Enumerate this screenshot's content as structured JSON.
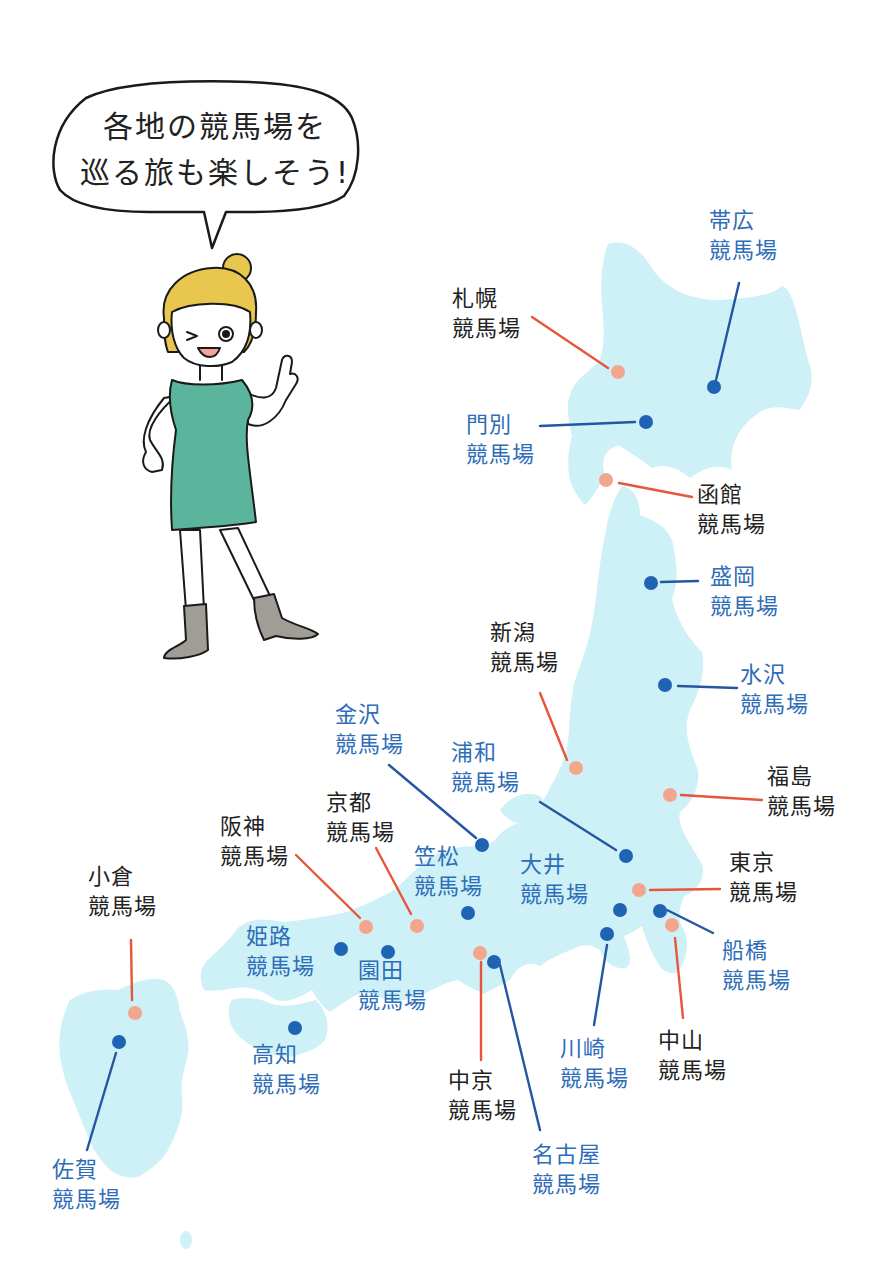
{
  "speech_bubble": {
    "line1": "各地の競馬場を",
    "line2": "巡る旅も楽しそう!"
  },
  "colors": {
    "land": "#cdf1f6",
    "jra_dot": "#f3a68e",
    "jra_line": "#e8553a",
    "nar_dot": "#1f63b5",
    "nar_line": "#2457a0",
    "jra_text": "#222222",
    "nar_text": "#2e6db8",
    "dress": "#5bb59c",
    "hair": "#e9c64d",
    "boots": "#a09c96"
  },
  "legend_note": {
    "jra": "salmon dot / black label",
    "nar": "blue dot / blue label"
  },
  "racecourses": [
    {
      "id": "obihiro",
      "name": "帯広",
      "suffix": "競馬場",
      "type": "nar"
    },
    {
      "id": "sapporo",
      "name": "札幌",
      "suffix": "競馬場",
      "type": "jra"
    },
    {
      "id": "monbetsu",
      "name": "門別",
      "suffix": "競馬場",
      "type": "nar"
    },
    {
      "id": "hakodate",
      "name": "函館",
      "suffix": "競馬場",
      "type": "jra"
    },
    {
      "id": "morioka",
      "name": "盛岡",
      "suffix": "競馬場",
      "type": "nar"
    },
    {
      "id": "niigata",
      "name": "新潟",
      "suffix": "競馬場",
      "type": "jra"
    },
    {
      "id": "mizusawa",
      "name": "水沢",
      "suffix": "競馬場",
      "type": "nar"
    },
    {
      "id": "kanazawa",
      "name": "金沢",
      "suffix": "競馬場",
      "type": "nar"
    },
    {
      "id": "urawa",
      "name": "浦和",
      "suffix": "競馬場",
      "type": "nar"
    },
    {
      "id": "fukushima",
      "name": "福島",
      "suffix": "競馬場",
      "type": "jra"
    },
    {
      "id": "kyoto",
      "name": "京都",
      "suffix": "競馬場",
      "type": "jra"
    },
    {
      "id": "hanshin",
      "name": "阪神",
      "suffix": "競馬場",
      "type": "jra"
    },
    {
      "id": "kasamatsu",
      "name": "笠松",
      "suffix": "競馬場",
      "type": "nar"
    },
    {
      "id": "ooi",
      "name": "大井",
      "suffix": "競馬場",
      "type": "nar"
    },
    {
      "id": "tokyo",
      "name": "東京",
      "suffix": "競馬場",
      "type": "jra"
    },
    {
      "id": "kokura",
      "name": "小倉",
      "suffix": "競馬場",
      "type": "jra"
    },
    {
      "id": "himeji",
      "name": "姫路",
      "suffix": "競馬場",
      "type": "nar"
    },
    {
      "id": "sonoda",
      "name": "園田",
      "suffix": "競馬場",
      "type": "nar"
    },
    {
      "id": "funabashi",
      "name": "船橋",
      "suffix": "競馬場",
      "type": "nar"
    },
    {
      "id": "kochi",
      "name": "高知",
      "suffix": "競馬場",
      "type": "nar"
    },
    {
      "id": "kawasaki",
      "name": "川崎",
      "suffix": "競馬場",
      "type": "nar"
    },
    {
      "id": "nakayama",
      "name": "中山",
      "suffix": "競馬場",
      "type": "jra"
    },
    {
      "id": "chukyo",
      "name": "中京",
      "suffix": "競馬場",
      "type": "jra"
    },
    {
      "id": "saga",
      "name": "佐賀",
      "suffix": "競馬場",
      "type": "nar"
    },
    {
      "id": "nagoya",
      "name": "名古屋",
      "suffix": "競馬場",
      "type": "nar"
    }
  ]
}
